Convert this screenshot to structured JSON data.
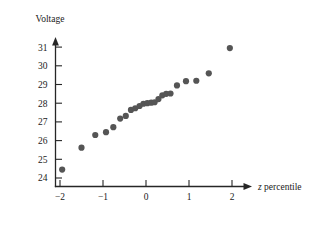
{
  "chart_data": {
    "type": "scatter",
    "title": "",
    "subtitle": "",
    "xlabel": "z percentile",
    "xlabel_italic_part": "z",
    "xlabel_rest_part": " percentile",
    "ylabel": "Voltage",
    "xlim": [
      -2.45,
      2.45
    ],
    "ylim": [
      23.45,
      31.45
    ],
    "xticks": [
      -2,
      -1,
      0,
      1,
      2
    ],
    "xticklabels": [
      "−2",
      "−1",
      "0",
      "1",
      "2"
    ],
    "yticks": [
      24,
      25,
      26,
      27,
      28,
      29,
      30,
      31
    ],
    "yticklabels": [
      "24",
      "25",
      "26",
      "27",
      "28",
      "29",
      "30",
      "31"
    ],
    "grid": false,
    "legend": null,
    "legend_position": "none",
    "marker": "circle",
    "marker_color": "#555555",
    "marker_size": 3.1,
    "n_points": 24,
    "x": [
      -1.95,
      -1.5,
      -1.18,
      -0.93,
      -0.76,
      -0.6,
      -0.47,
      -0.35,
      -0.25,
      -0.15,
      -0.06,
      0.03,
      0.12,
      0.2,
      0.29,
      0.38,
      0.47,
      0.57,
      0.72,
      0.93,
      1.17,
      1.46,
      1.95
    ],
    "y": [
      24.45,
      25.62,
      26.3,
      26.45,
      26.72,
      27.18,
      27.32,
      27.64,
      27.73,
      27.85,
      27.97,
      28.0,
      28.03,
      28.05,
      28.22,
      28.42,
      28.5,
      28.52,
      28.95,
      29.18,
      29.2,
      29.6,
      30.95
    ],
    "points": [
      {
        "x": -1.95,
        "y": 24.45
      },
      {
        "x": -1.5,
        "y": 25.62
      },
      {
        "x": -1.18,
        "y": 26.3
      },
      {
        "x": -0.93,
        "y": 26.45
      },
      {
        "x": -0.76,
        "y": 26.72
      },
      {
        "x": -0.6,
        "y": 27.18
      },
      {
        "x": -0.47,
        "y": 27.32
      },
      {
        "x": -0.35,
        "y": 27.64
      },
      {
        "x": -0.25,
        "y": 27.73
      },
      {
        "x": -0.15,
        "y": 27.85
      },
      {
        "x": -0.06,
        "y": 27.97
      },
      {
        "x": 0.03,
        "y": 28.0
      },
      {
        "x": 0.12,
        "y": 28.03
      },
      {
        "x": 0.2,
        "y": 28.05
      },
      {
        "x": 0.29,
        "y": 28.22
      },
      {
        "x": 0.38,
        "y": 28.42
      },
      {
        "x": 0.47,
        "y": 28.5
      },
      {
        "x": 0.57,
        "y": 28.52
      },
      {
        "x": 0.72,
        "y": 28.95
      },
      {
        "x": 0.93,
        "y": 29.18
      },
      {
        "x": 1.17,
        "y": 29.2
      },
      {
        "x": 1.46,
        "y": 29.6
      },
      {
        "x": 1.95,
        "y": 30.95
      }
    ]
  },
  "axes": {
    "y_axis_title": "Voltage",
    "x_axis_title_italic": "z",
    "x_axis_title_plain": " percentile"
  }
}
